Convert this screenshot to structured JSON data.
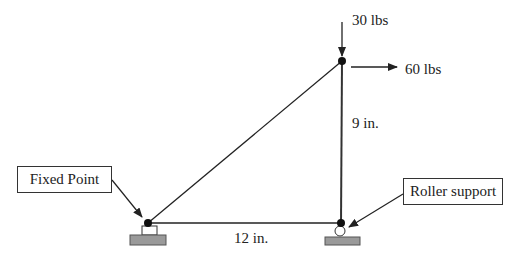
{
  "diagram": {
    "type": "truss",
    "loads": {
      "vertical": {
        "label": "30 lbs",
        "direction": "down"
      },
      "horizontal": {
        "label": "60 lbs",
        "direction": "right"
      }
    },
    "dimensions": {
      "height": "9 in.",
      "width": "12 in."
    },
    "callouts": {
      "fixed": "Fixed Point",
      "roller": "Roller support"
    },
    "nodes": [
      {
        "id": "A",
        "role": "fixed support",
        "x": 148,
        "y": 223
      },
      {
        "id": "B",
        "role": "roller support",
        "x": 341,
        "y": 223
      },
      {
        "id": "C",
        "role": "loaded joint",
        "x": 342,
        "y": 61
      }
    ],
    "members": [
      [
        "A",
        "B"
      ],
      [
        "A",
        "C"
      ],
      [
        "B",
        "C"
      ]
    ],
    "colors": {
      "line": "#222222",
      "ground": "#999999",
      "node": "#111111"
    }
  }
}
